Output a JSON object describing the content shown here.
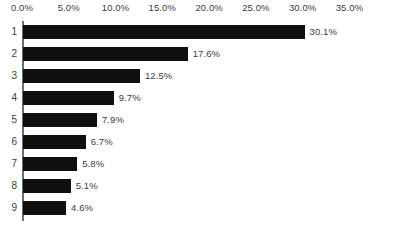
{
  "chart_data": {
    "type": "bar",
    "orientation": "horizontal",
    "title": "",
    "subtitle": "",
    "xlabel": "",
    "ylabel": "",
    "grid": false,
    "legend": false,
    "legend_position": "none",
    "xlim": [
      0,
      35
    ],
    "x_tick_labels": [
      "0.0%",
      "5.0%",
      "10.0%",
      "15.0%",
      "20.0%",
      "25.0%",
      "30.0%",
      "35.0%"
    ],
    "x_tick_values": [
      0,
      5,
      10,
      15,
      20,
      25,
      30,
      35
    ],
    "x_axis_position": "top",
    "categories": [
      "1",
      "2",
      "3",
      "4",
      "5",
      "6",
      "7",
      "8",
      "9"
    ],
    "values": [
      30.1,
      17.6,
      12.5,
      9.7,
      7.9,
      6.7,
      5.8,
      5.1,
      4.6
    ],
    "value_labels": [
      "30.1%",
      "17.6%",
      "12.5%",
      "9.7%",
      "7.9%",
      "6.7%",
      "5.8%",
      "5.1%",
      "4.6%"
    ],
    "bar_color": "#100f0f",
    "text_color": "#3c3c3c",
    "axis_color": "#6e6e6e",
    "background_color": "#ffffff"
  }
}
